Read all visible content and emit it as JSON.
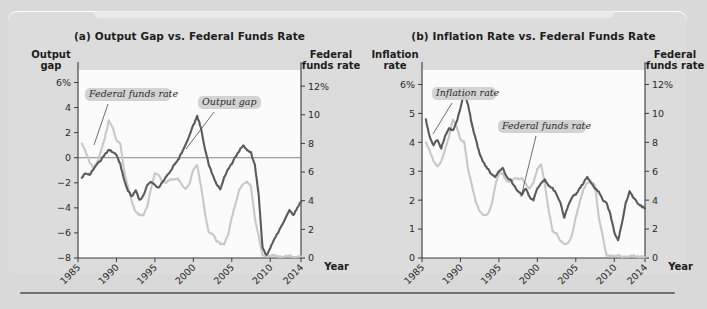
{
  "figure": {
    "background_color": "#dcdcdc",
    "series_colors": {
      "dark_line": "#5a5a5a",
      "light_line": "#c8c8c8",
      "axis": "#3a3a3a"
    }
  },
  "panels": [
    {
      "id": "a",
      "title": "(a) Output Gap vs. Federal Funds Rate",
      "left_axis_caption": "Output gap",
      "right_axis_caption": "Federal funds rate",
      "xlabel": "Year",
      "callouts": [
        {
          "text": "Federal funds rate"
        },
        {
          "text": "Output gap"
        }
      ]
    },
    {
      "id": "b",
      "title": "(b) Inflation Rate vs. Federal Funds Rate",
      "left_axis_caption": "Inflation rate",
      "right_axis_caption": "Federal funds rate",
      "xlabel": "Year",
      "callouts": [
        {
          "text": "Inflation rate"
        },
        {
          "text": "Federal funds rate"
        }
      ]
    }
  ],
  "chart_data": [
    {
      "type": "line",
      "panel": "a",
      "title": "(a) Output Gap vs. Federal Funds Rate",
      "xlabel": "Year",
      "ylabel": "Output gap",
      "y2label": "Federal funds rate",
      "xlim": [
        1985,
        2014
      ],
      "ylim": [
        -8,
        7
      ],
      "y2lim": [
        0,
        13.125
      ],
      "yticks": [
        6,
        4,
        2,
        0,
        -2,
        -4,
        -6,
        -8
      ],
      "ytick_labels": [
        "6%",
        "4",
        "2",
        "0",
        "-2",
        "-4",
        "-6",
        "-8"
      ],
      "y2ticks": [
        12,
        10,
        8,
        6,
        4,
        2,
        0
      ],
      "y2tick_labels": [
        "12%",
        "10",
        "8",
        "6",
        "4",
        "2",
        "0"
      ],
      "xticks": [
        1985,
        1990,
        1995,
        2000,
        2005,
        2010,
        2014
      ],
      "xtick_labels": [
        "1985",
        "1990",
        "1995",
        "2000",
        "2005",
        "2010",
        "2014"
      ],
      "zero_line": 0,
      "grid": false,
      "legend_position": "inline-callouts",
      "series": [
        {
          "name": "Output gap",
          "axis": "left",
          "color": "#5a5a5a",
          "x": [
            1985.5,
            1986,
            1986.5,
            1987,
            1987.5,
            1988,
            1988.5,
            1989,
            1989.5,
            1990,
            1990.5,
            1991,
            1991.5,
            1992,
            1992.5,
            1993,
            1993.5,
            1994,
            1994.5,
            1995,
            1995.5,
            1996,
            1996.5,
            1997,
            1997.5,
            1998,
            1998.5,
            1999,
            1999.5,
            2000,
            2000.5,
            2001,
            2001.5,
            2002,
            2002.5,
            2003,
            2003.5,
            2004,
            2004.5,
            2005,
            2005.5,
            2006,
            2006.5,
            2007,
            2007.5,
            2008,
            2008.5,
            2009,
            2009.5,
            2010,
            2010.5,
            2011,
            2011.5,
            2012,
            2012.5,
            2013,
            2013.5,
            2014
          ],
          "values": [
            -1.6,
            -1.2,
            -1.4,
            -0.9,
            -0.5,
            -0.2,
            0.3,
            0.6,
            0.5,
            0.2,
            -0.5,
            -1.8,
            -2.6,
            -3.1,
            -2.6,
            -3.4,
            -3.0,
            -2.2,
            -1.9,
            -2.2,
            -2.4,
            -1.9,
            -1.5,
            -1.1,
            -0.6,
            -0.2,
            0.4,
            1.1,
            1.8,
            2.6,
            3.3,
            2.4,
            0.7,
            -0.5,
            -1.4,
            -2.1,
            -2.5,
            -1.6,
            -0.9,
            -0.5,
            0.1,
            0.6,
            1.0,
            0.6,
            0.4,
            -0.6,
            -3.0,
            -7.2,
            -7.8,
            -7.2,
            -6.5,
            -6.0,
            -5.4,
            -4.8,
            -4.2,
            -4.6,
            -4.0,
            -3.5
          ]
        },
        {
          "name": "Federal funds rate",
          "axis": "right",
          "color": "#c8c8c8",
          "x": [
            1985.5,
            1986,
            1986.5,
            1987,
            1987.5,
            1988,
            1988.5,
            1989,
            1989.5,
            1990,
            1990.5,
            1991,
            1991.5,
            1992,
            1992.5,
            1993,
            1993.5,
            1994,
            1994.5,
            1995,
            1995.5,
            1996,
            1996.5,
            1997,
            1997.5,
            1998,
            1998.5,
            1999,
            1999.5,
            2000,
            2000.5,
            2001,
            2001.5,
            2002,
            2002.5,
            2003,
            2003.5,
            2004,
            2004.5,
            2005,
            2005.5,
            2006,
            2006.5,
            2007,
            2007.5,
            2008,
            2008.5,
            2009,
            2009.5,
            2010,
            2010.5,
            2011,
            2011.5,
            2012,
            2012.5,
            2013,
            2013.5,
            2014
          ],
          "values": [
            8.0,
            7.4,
            6.7,
            6.3,
            6.7,
            7.5,
            8.4,
            9.6,
            9.1,
            8.2,
            8.0,
            6.1,
            5.0,
            3.9,
            3.2,
            3.0,
            3.0,
            3.6,
            4.9,
            5.9,
            5.8,
            5.3,
            5.3,
            5.5,
            5.5,
            5.5,
            5.1,
            4.8,
            5.2,
            6.2,
            6.5,
            5.0,
            3.2,
            1.8,
            1.7,
            1.2,
            1.0,
            1.0,
            1.6,
            2.8,
            3.8,
            4.8,
            5.2,
            5.3,
            5.0,
            2.8,
            1.5,
            0.2,
            0.15,
            0.15,
            0.18,
            0.1,
            0.08,
            0.12,
            0.15,
            0.1,
            0.09,
            0.08
          ]
        }
      ]
    },
    {
      "type": "line",
      "panel": "b",
      "title": "(b) Inflation Rate vs. Federal Funds Rate",
      "xlabel": "Year",
      "ylabel": "Inflation rate",
      "y2label": "Federal funds rate",
      "xlim": [
        1985,
        2014
      ],
      "ylim": [
        0,
        6.5
      ],
      "y2lim": [
        0,
        13
      ],
      "yticks": [
        6,
        5,
        4,
        3,
        2,
        1,
        0
      ],
      "ytick_labels": [
        "6%",
        "5",
        "4",
        "3",
        "2",
        "1",
        "0"
      ],
      "y2ticks": [
        12,
        10,
        8,
        6,
        4,
        2,
        0
      ],
      "y2tick_labels": [
        "12%",
        "10",
        "8",
        "6",
        "4",
        "2",
        "0"
      ],
      "xticks": [
        1985,
        1990,
        1995,
        2000,
        2005,
        2010,
        2014
      ],
      "xtick_labels": [
        "1985",
        "1990",
        "1995",
        "2000",
        "2005",
        "2010",
        "2014"
      ],
      "grid": false,
      "legend_position": "inline-callouts",
      "series": [
        {
          "name": "Inflation rate",
          "axis": "left",
          "color": "#5a5a5a",
          "x": [
            1985.5,
            1986,
            1986.5,
            1987,
            1987.5,
            1988,
            1988.5,
            1989,
            1989.5,
            1990,
            1990.5,
            1991,
            1991.5,
            1992,
            1992.5,
            1993,
            1993.5,
            1994,
            1994.5,
            1995,
            1995.5,
            1996,
            1996.5,
            1997,
            1997.5,
            1998,
            1998.5,
            1999,
            1999.5,
            2000,
            2000.5,
            2001,
            2001.5,
            2002,
            2002.5,
            2003,
            2003.5,
            2004,
            2004.5,
            2005,
            2005.5,
            2006,
            2006.5,
            2007,
            2007.5,
            2008,
            2008.5,
            2009,
            2009.5,
            2010,
            2010.5,
            2011,
            2011.5,
            2012,
            2012.5,
            2013,
            2013.5,
            2014
          ],
          "values": [
            4.8,
            4.2,
            3.9,
            4.1,
            3.8,
            4.2,
            4.5,
            4.4,
            4.7,
            5.2,
            5.7,
            5.3,
            4.6,
            4.1,
            3.6,
            3.3,
            3.1,
            2.9,
            2.8,
            3.0,
            3.1,
            2.8,
            2.7,
            2.5,
            2.3,
            2.2,
            2.4,
            2.1,
            2.0,
            2.4,
            2.6,
            2.7,
            2.5,
            2.4,
            2.2,
            1.9,
            1.4,
            1.8,
            2.1,
            2.2,
            2.4,
            2.6,
            2.8,
            2.6,
            2.4,
            2.3,
            2.0,
            1.9,
            1.5,
            0.9,
            0.6,
            1.2,
            1.9,
            2.3,
            2.1,
            1.9,
            1.8,
            1.7
          ]
        },
        {
          "name": "Federal funds rate",
          "axis": "right",
          "color": "#c8c8c8",
          "x": [
            1985.5,
            1986,
            1986.5,
            1987,
            1987.5,
            1988,
            1988.5,
            1989,
            1989.5,
            1990,
            1990.5,
            1991,
            1991.5,
            1992,
            1992.5,
            1993,
            1993.5,
            1994,
            1994.5,
            1995,
            1995.5,
            1996,
            1996.5,
            1997,
            1997.5,
            1998,
            1998.5,
            1999,
            1999.5,
            2000,
            2000.5,
            2001,
            2001.5,
            2002,
            2002.5,
            2003,
            2003.5,
            2004,
            2004.5,
            2005,
            2005.5,
            2006,
            2006.5,
            2007,
            2007.5,
            2008,
            2008.5,
            2009,
            2009.5,
            2010,
            2010.5,
            2011,
            2011.5,
            2012,
            2012.5,
            2013,
            2013.5,
            2014
          ],
          "values": [
            8.0,
            7.4,
            6.7,
            6.3,
            6.7,
            7.5,
            8.4,
            9.6,
            9.1,
            8.2,
            8.0,
            6.1,
            5.0,
            3.9,
            3.2,
            3.0,
            3.0,
            3.6,
            4.9,
            5.9,
            5.8,
            5.3,
            5.3,
            5.5,
            5.5,
            5.5,
            5.1,
            4.8,
            5.2,
            6.2,
            6.5,
            5.0,
            3.2,
            1.8,
            1.7,
            1.2,
            1.0,
            1.0,
            1.6,
            2.8,
            3.8,
            4.8,
            5.2,
            5.3,
            5.0,
            2.8,
            1.5,
            0.2,
            0.15,
            0.15,
            0.18,
            0.1,
            0.08,
            0.12,
            0.15,
            0.1,
            0.09,
            0.08
          ]
        }
      ]
    }
  ]
}
